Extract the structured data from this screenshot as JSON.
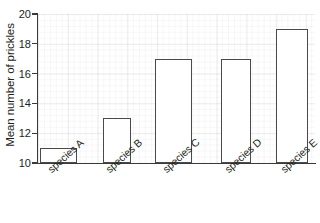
{
  "chart_data": {
    "type": "bar",
    "title": "",
    "xlabel": "",
    "ylabel": "Mean number of prickles",
    "categories": [
      "species A",
      "species B",
      "species C",
      "species D",
      "species E"
    ],
    "values": [
      11,
      13,
      17,
      17,
      19
    ],
    "ylim": [
      10,
      20
    ],
    "ytick_labels": [
      "10",
      "12",
      "14",
      "16",
      "18",
      "20"
    ],
    "ytick_values": [
      10,
      12,
      14,
      16,
      18,
      20
    ],
    "grid": true,
    "legend": "none",
    "bar_fill_color": "#ffffff",
    "bar_edge_color": "#4a4a4d",
    "axis_color": "#3a3a3c",
    "grid_color": "#b4b6bc",
    "background_color": "#ffffff",
    "text_color": "#231f20",
    "xtick_rotation_degrees": -42
  }
}
